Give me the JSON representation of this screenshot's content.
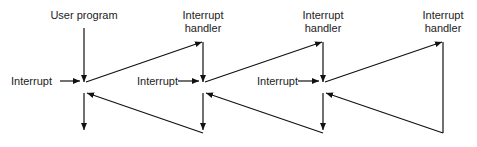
{
  "labels": {
    "user_program": "User program",
    "handler_line1": "Interrupt",
    "handler_line2": "handler",
    "interrupt": "Interrupt"
  },
  "handlers": [
    {
      "line1": "Interrupt",
      "line2": "handler"
    },
    {
      "line1": "Interrupt",
      "line2": "handler"
    },
    {
      "line1": "Interrupt",
      "line2": "handler"
    }
  ],
  "interrupts": [
    "Interrupt",
    "Interrupt",
    "Interrupt"
  ]
}
